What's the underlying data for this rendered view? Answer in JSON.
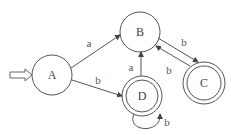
{
  "diagram": {
    "type": "finite-automaton",
    "start_state": "A",
    "states": [
      {
        "id": "A",
        "label": "A",
        "accepting": false,
        "cx": 52,
        "cy": 75
      },
      {
        "id": "B",
        "label": "B",
        "accepting": false,
        "cx": 140,
        "cy": 32
      },
      {
        "id": "C",
        "label": "C",
        "accepting": true,
        "cx": 204,
        "cy": 83
      },
      {
        "id": "D",
        "label": "D",
        "accepting": true,
        "cx": 142,
        "cy": 96
      }
    ],
    "transitions": [
      {
        "from": "A",
        "to": "B",
        "label": "a"
      },
      {
        "from": "A",
        "to": "D",
        "label": "b"
      },
      {
        "from": "D",
        "to": "B",
        "label": "a"
      },
      {
        "from": "B",
        "to": "C",
        "label": "b"
      },
      {
        "from": "C",
        "to": "B",
        "label": "b"
      },
      {
        "from": "D",
        "to": "D",
        "label": "b"
      }
    ],
    "colors": {
      "stroke": "#555555",
      "text": "#444444",
      "background": "#ffffff"
    }
  }
}
